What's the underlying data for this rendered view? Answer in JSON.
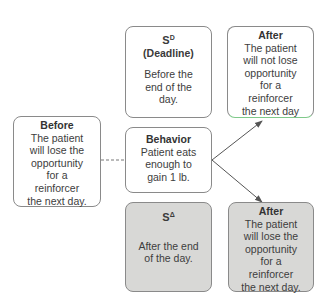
{
  "diagram": {
    "sd_box": {
      "symbol": "S",
      "superscript": "D",
      "subtitle": "(Deadline)",
      "lines": [
        "Before the",
        "end of the",
        "day."
      ]
    },
    "after_top": {
      "title": "After",
      "lines": [
        "The patient",
        "will not lose",
        "opportunity",
        "for a",
        "reinforcer",
        "the next day"
      ]
    },
    "before": {
      "title": "Before",
      "lines": [
        "The patient",
        "will lose the",
        "opportunity",
        "for a",
        "reinforcer",
        "the next day."
      ]
    },
    "behavior": {
      "title": "Behavior",
      "lines": [
        "Patient eats",
        "enough to",
        "gain 1 lb."
      ]
    },
    "sdelta_box": {
      "symbol": "S",
      "superscript": "Δ",
      "lines": [
        "After the end",
        "of the day."
      ]
    },
    "after_bottom": {
      "title": "After",
      "lines": [
        "The patient",
        "will lose the",
        "opportunity",
        "for a",
        "reinforcer",
        "the next day."
      ]
    },
    "colors": {
      "border": "#8a8a8a",
      "shaded_fill": "#d8d8d6",
      "arrow": "#555555"
    }
  }
}
